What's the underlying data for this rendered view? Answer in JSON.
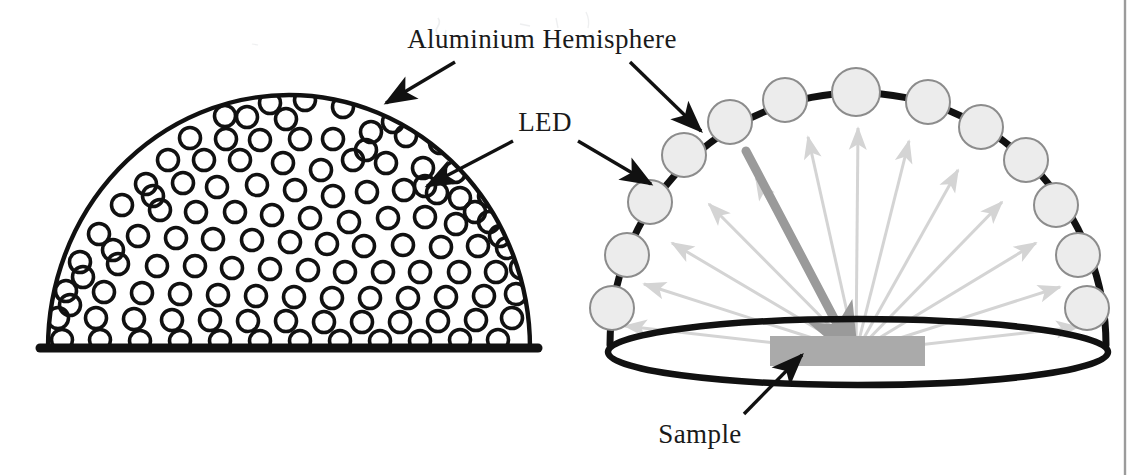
{
  "figure": {
    "caption_labels": {
      "hemisphere": "Aluminium Hemisphere",
      "led": "LED",
      "sample": "Sample"
    },
    "colors": {
      "outline": "#111111",
      "led_fill": "#ececec",
      "led_stroke": "#8c8c8c",
      "ray_gray": "#d4d4d4",
      "beam_gray": "#9a9a9a",
      "sample_gray": "#aaaaaa",
      "page_border": "#9b9b9b",
      "background": "#ffffff",
      "text": "#1a1a1a"
    },
    "panels": [
      {
        "id": "left-panel",
        "name": "cutaway-hemisphere",
        "description": "Aluminium hemisphere shown as a dome perforated with many circular LED apertures",
        "dome": {
          "cx": 289,
          "base_y": 348,
          "rx": 241,
          "ry": 253
        },
        "aperture_radius": 10.5,
        "aperture_count": 122
      },
      {
        "id": "right-panel",
        "name": "led-array-hemisphere",
        "description": "Hemisphere arc studded with LEDs illuminating a sample; gray rays show light paths",
        "arc": {
          "cx": 858,
          "base_y": 345,
          "rx": 248,
          "ry": 252
        },
        "base_ellipse": {
          "cx": 858,
          "cy": 352,
          "rx": 250,
          "ry": 33
        },
        "sample_rect": {
          "x": 770,
          "y": 336,
          "width": 155,
          "height": 30
        },
        "led_count": 13,
        "ray_count": 13,
        "led_radius": 22,
        "beam": {
          "from_x": 746,
          "from_y": 151,
          "to_x": 856,
          "to_y": 361
        }
      }
    ],
    "annotations": [
      {
        "name": "hemisphere-label-left-arrow",
        "label_ref": "hemisphere",
        "from": [
          455,
          62
        ],
        "to": [
          384,
          104
        ]
      },
      {
        "name": "hemisphere-label-right-arrow",
        "label_ref": "hemisphere",
        "from": [
          628,
          62
        ],
        "to": [
          700,
          132
        ]
      },
      {
        "name": "led-label-left-arrow",
        "label_ref": "led",
        "from": [
          515,
          140
        ],
        "to": [
          424,
          187
        ]
      },
      {
        "name": "led-label-right-arrow",
        "label_ref": "led",
        "from": [
          575,
          140
        ],
        "to": [
          652,
          185
        ]
      },
      {
        "name": "sample-label-arrow",
        "label_ref": "sample",
        "from": [
          745,
          415
        ],
        "to": [
          801,
          355
        ]
      }
    ],
    "text_positions": {
      "hemisphere": {
        "x": 542,
        "y": 48,
        "anchor": "middle"
      },
      "led": {
        "x": 545,
        "y": 131,
        "anchor": "middle"
      },
      "sample": {
        "x": 700,
        "y": 443,
        "anchor": "middle"
      }
    }
  }
}
